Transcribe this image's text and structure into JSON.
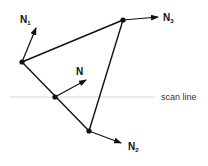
{
  "diagram": {
    "scan_line_label": "scan line",
    "vertices": [
      {
        "id": "v1",
        "x": 22,
        "y": 62
      },
      {
        "id": "v2",
        "x": 89,
        "y": 131
      },
      {
        "id": "v3",
        "x": 123,
        "y": 20
      },
      {
        "id": "p",
        "x": 55,
        "y": 97
      }
    ],
    "normals": [
      {
        "id": "N1",
        "label": "N",
        "subscript": "1"
      },
      {
        "id": "N2",
        "label": "N",
        "subscript": "2"
      },
      {
        "id": "N3",
        "label": "N",
        "subscript": "3"
      },
      {
        "id": "N",
        "label": "N",
        "subscript": ""
      }
    ]
  }
}
